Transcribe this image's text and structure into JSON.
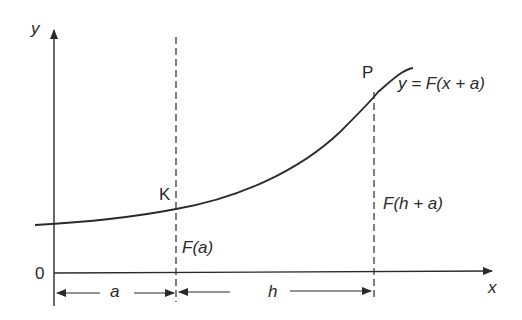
{
  "diagram": {
    "axes": {
      "x_label": "x",
      "y_label": "y",
      "origin_label": "0"
    },
    "curve": {
      "equation_label": "y = F(x + a)"
    },
    "points": [
      {
        "name": "K",
        "label": "K",
        "value_label": "F(a)"
      },
      {
        "name": "P",
        "label": "P",
        "value_label": "F(h + a)"
      }
    ],
    "dimensions": [
      {
        "label": "a"
      },
      {
        "label": "h"
      }
    ],
    "colors": {
      "line": "#2a2a2a",
      "background": "#ffffff"
    }
  }
}
